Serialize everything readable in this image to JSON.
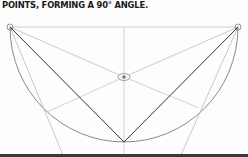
{
  "caption": "POINTS, FORMING A 90° ANGLE.",
  "diagram": {
    "points": [
      "left-endpoint",
      "right-endpoint",
      "center",
      "bottom-vertex"
    ],
    "angle_label": "90°",
    "colors": {
      "ink_dark": "#333333",
      "ink_light": "#b5b5b5",
      "arc": "#8a8a8a",
      "bar": "#3a3a3a"
    }
  }
}
